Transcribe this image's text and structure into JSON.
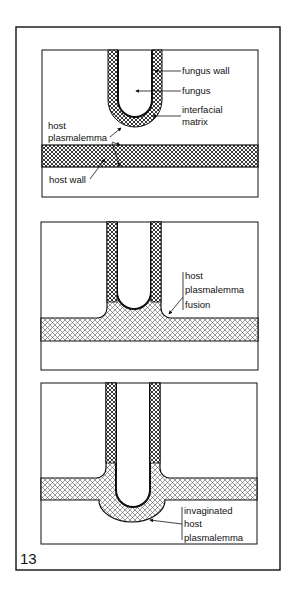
{
  "figure": {
    "number": "13",
    "panels": [
      {
        "id": "panel-1",
        "labels": {
          "fungus_wall": "fungus wall",
          "fungus": "fungus",
          "interfacial_matrix_1": "interfacial",
          "interfacial_matrix_2": "matrix",
          "host_plasmalemma_1": "host",
          "host_plasmalemma_2": "plasmalemma",
          "host_wall": "host wall"
        }
      },
      {
        "id": "panel-2",
        "labels": {
          "line1": "host",
          "line2": "plasmalemma",
          "line3": "fusion"
        }
      },
      {
        "id": "panel-3",
        "labels": {
          "line1": "invaginated",
          "line2": "host",
          "line3": "plasmalemma"
        }
      }
    ],
    "caption": ""
  },
  "colors": {
    "ink": "#111111",
    "background": "#ffffff"
  }
}
